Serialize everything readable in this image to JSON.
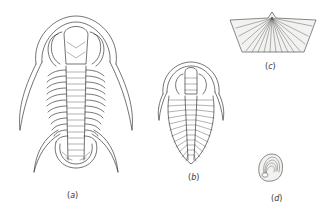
{
  "figure": {
    "panels": [
      {
        "id": "a",
        "label_open": "(",
        "label_letter": "a",
        "label_close": ")",
        "subject": "trilobite with long genal and pygidial spines"
      },
      {
        "id": "b",
        "label_open": "(",
        "label_letter": "b",
        "label_close": ")",
        "subject": "small trilobite, dorsal view"
      },
      {
        "id": "c",
        "label_open": "(",
        "label_letter": "c",
        "label_close": ")",
        "subject": "brachiopod shell with radial ribs"
      },
      {
        "id": "d",
        "label_open": "(",
        "label_letter": "d",
        "label_close": ")",
        "subject": "small shell with concentric growth lines"
      }
    ],
    "colors": {
      "line": "#3a3a3a",
      "background": "#ffffff",
      "label": "#333333"
    }
  }
}
